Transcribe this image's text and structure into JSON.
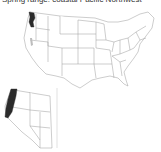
{
  "map": {
    "title": "Spring range: coastal Pacific Northwest",
    "main_map": {
      "region": "Contiguous United States",
      "highlighted": [
        "Western Washington"
      ]
    },
    "inset_map": {
      "region": "Western United States",
      "highlighted": [
        "Coastal Washington",
        "Coastal Oregon",
        "Northwestern California"
      ]
    },
    "colors": {
      "highlight": "#2b2b2b",
      "secondary": "#bdbdbd",
      "border": "#9a9a9a",
      "background": "#ffffff"
    }
  }
}
